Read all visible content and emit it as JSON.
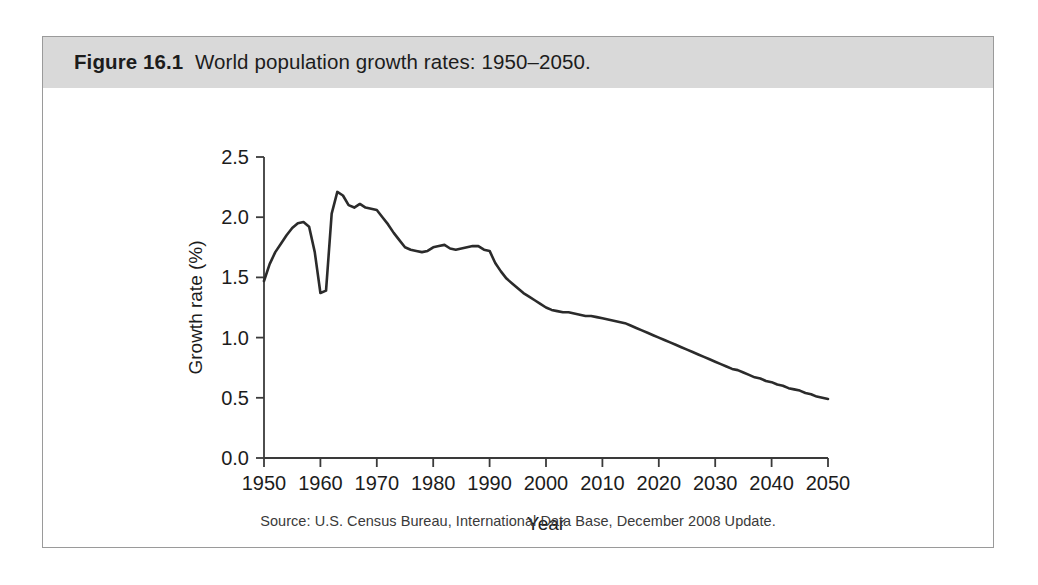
{
  "figure": {
    "label": "Figure 16.1",
    "title": "World population growth rates: 1950–2050.",
    "source_note": "Source: U.S. Census Bureau, International Data Base, December 2008 Update."
  },
  "colors": {
    "caption_band": "#d9d9d9",
    "frame_border": "#9a9a9a",
    "line": "#2b2b2b",
    "axis": "#3a3a3a",
    "text": "#1c1c1c",
    "background": "#ffffff"
  },
  "chart_data": {
    "type": "line",
    "title": "World population growth rates: 1950–2050.",
    "xlabel": "Year",
    "ylabel": "Growth rate (%)",
    "xlim": [
      1950,
      2050
    ],
    "ylim": [
      0.0,
      2.5
    ],
    "grid": false,
    "legend": null,
    "xticks": [
      1950,
      1960,
      1970,
      1980,
      1990,
      2000,
      2010,
      2020,
      2030,
      2040,
      2050
    ],
    "xtick_labels": [
      "1950",
      "1960",
      "1970",
      "1980",
      "1990",
      "2000",
      "2010",
      "2020",
      "2030",
      "2040",
      "2050"
    ],
    "yticks": [
      0.0,
      0.5,
      1.0,
      1.5,
      2.0,
      2.5
    ],
    "ytick_labels": [
      "0.0",
      "0.5",
      "1.0",
      "1.5",
      "2.0",
      "2.5"
    ],
    "series": [
      {
        "name": "World population growth rate",
        "x": [
          1950,
          1951,
          1952,
          1953,
          1954,
          1955,
          1956,
          1957,
          1958,
          1959,
          1960,
          1961,
          1962,
          1963,
          1964,
          1965,
          1966,
          1967,
          1968,
          1969,
          1970,
          1971,
          1972,
          1973,
          1974,
          1975,
          1976,
          1977,
          1978,
          1979,
          1980,
          1981,
          1982,
          1983,
          1984,
          1985,
          1986,
          1987,
          1988,
          1989,
          1990,
          1991,
          1992,
          1993,
          1994,
          1995,
          1996,
          1997,
          1998,
          1999,
          2000,
          2001,
          2002,
          2003,
          2004,
          2005,
          2006,
          2007,
          2008,
          2009,
          2010,
          2011,
          2012,
          2013,
          2014,
          2015,
          2016,
          2017,
          2018,
          2019,
          2020,
          2021,
          2022,
          2023,
          2024,
          2025,
          2026,
          2027,
          2028,
          2029,
          2030,
          2031,
          2032,
          2033,
          2034,
          2035,
          2036,
          2037,
          2038,
          2039,
          2040,
          2041,
          2042,
          2043,
          2044,
          2045,
          2046,
          2047,
          2048,
          2049,
          2050
        ],
        "y": [
          1.47,
          1.61,
          1.71,
          1.78,
          1.85,
          1.91,
          1.95,
          1.96,
          1.92,
          1.71,
          1.37,
          1.39,
          2.03,
          2.21,
          2.18,
          2.1,
          2.08,
          2.11,
          2.08,
          2.07,
          2.06,
          2.0,
          1.94,
          1.87,
          1.81,
          1.75,
          1.73,
          1.72,
          1.71,
          1.72,
          1.75,
          1.76,
          1.77,
          1.74,
          1.73,
          1.74,
          1.75,
          1.76,
          1.76,
          1.73,
          1.72,
          1.62,
          1.55,
          1.49,
          1.45,
          1.41,
          1.37,
          1.34,
          1.31,
          1.28,
          1.25,
          1.23,
          1.22,
          1.21,
          1.21,
          1.2,
          1.19,
          1.18,
          1.18,
          1.17,
          1.16,
          1.15,
          1.14,
          1.13,
          1.12,
          1.1,
          1.08,
          1.06,
          1.04,
          1.02,
          1.0,
          0.98,
          0.96,
          0.94,
          0.92,
          0.9,
          0.88,
          0.86,
          0.84,
          0.82,
          0.8,
          0.78,
          0.76,
          0.74,
          0.73,
          0.71,
          0.69,
          0.67,
          0.66,
          0.64,
          0.63,
          0.61,
          0.6,
          0.58,
          0.57,
          0.56,
          0.54,
          0.53,
          0.51,
          0.5,
          0.49
        ],
        "color": "#2b2b2b",
        "style": "solid",
        "width": 2.6
      }
    ],
    "annotations": [
      {
        "text": "peak 2.21% around 1963"
      },
      {
        "text": "sharp dip to 1.37% around 1960"
      }
    ]
  }
}
